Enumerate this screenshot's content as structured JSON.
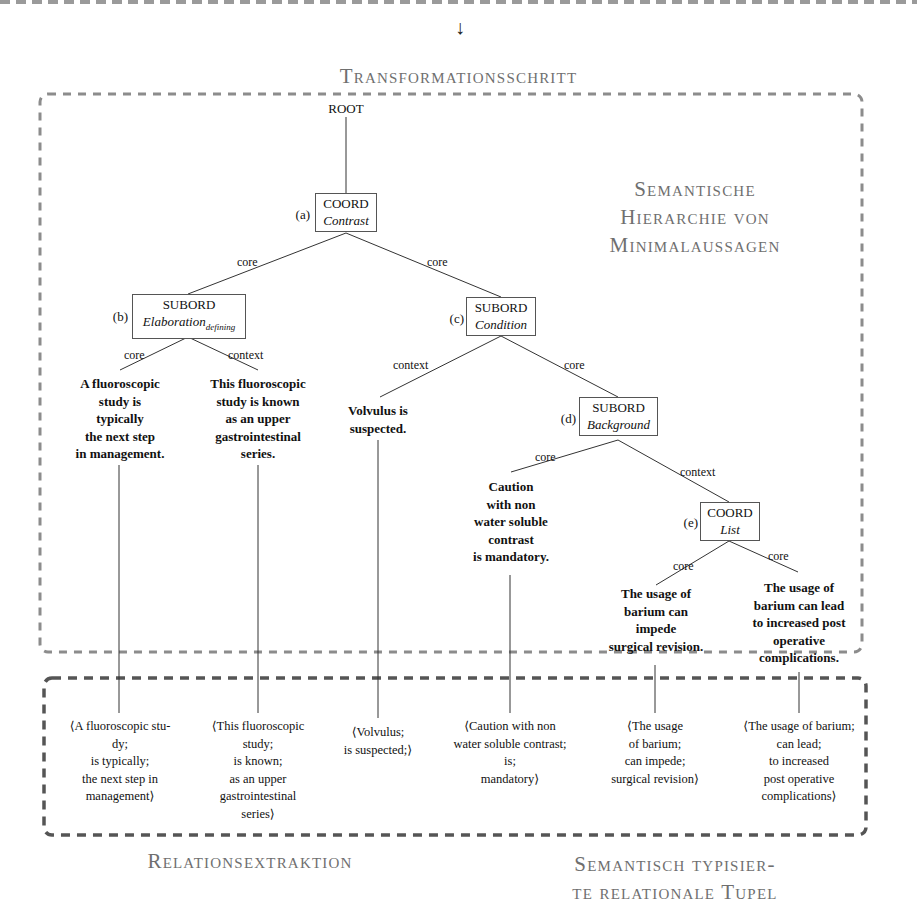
{
  "header": {
    "arrow": "↓",
    "transformation_title": "Transformationsschritt"
  },
  "tree": {
    "section_title_lines": [
      "Semantische",
      "Hierarchie von",
      "Minimalaussagen"
    ],
    "root": "ROOT",
    "nodes": [
      {
        "id": "a",
        "label": "(a)",
        "type": "COORD",
        "relation": "Contrast",
        "relation_sub": ""
      },
      {
        "id": "b",
        "label": "(b)",
        "type": "SUBORD",
        "relation": "Elaboration",
        "relation_sub": "defining"
      },
      {
        "id": "c",
        "label": "(c)",
        "type": "SUBORD",
        "relation": "Condition",
        "relation_sub": ""
      },
      {
        "id": "d",
        "label": "(d)",
        "type": "SUBORD",
        "relation": "Background",
        "relation_sub": ""
      },
      {
        "id": "e",
        "label": "(e)",
        "type": "COORD",
        "relation": "List",
        "relation_sub": ""
      }
    ],
    "edge_labels": {
      "a_b": "core",
      "a_c": "core",
      "b_leaf1": "core",
      "b_leaf2": "context",
      "c_leaf3": "context",
      "c_d": "core",
      "d_leaf4": "core",
      "d_e": "context",
      "e_leaf5": "core",
      "e_leaf6": "core"
    },
    "leaves": [
      "A fluoroscopic\nstudy is\ntypically\nthe next step\nin management.",
      "This fluoroscopic\nstudy is known\nas an upper\ngastrointestinal\nseries.",
      "Volvulus is\nsuspected.",
      "Caution\nwith non\nwater soluble\ncontrast\nis mandatory.",
      "The usage of\nbarium can\nimpede\nsurgical revision.",
      "The usage of\nbarium can lead\nto increased post\noperative\ncomplications."
    ]
  },
  "tuples": {
    "items": [
      "⟨A fluoroscopic stu-\ndy;\nis typically;\nthe next step in\nmanagement⟩",
      "⟨This fluoroscopic\nstudy;\nis known;\nas an upper\ngastrointestinal\nseries⟩",
      "⟨Volvulus;\nis suspected;⟩",
      "⟨Caution with non\nwater soluble contrast;\nis;\nmandatory⟩",
      "⟨The usage\nof barium;\ncan impede;\nsurgical revision⟩",
      "⟨The usage of barium;\ncan lead;\nto increased\npost operative\ncomplications⟩"
    ]
  },
  "footer": {
    "relation_extraction_title": "Relationsextraktion",
    "typed_tuples_title_lines": [
      "Semantisch typisier-",
      "te relationale Tupel"
    ]
  }
}
